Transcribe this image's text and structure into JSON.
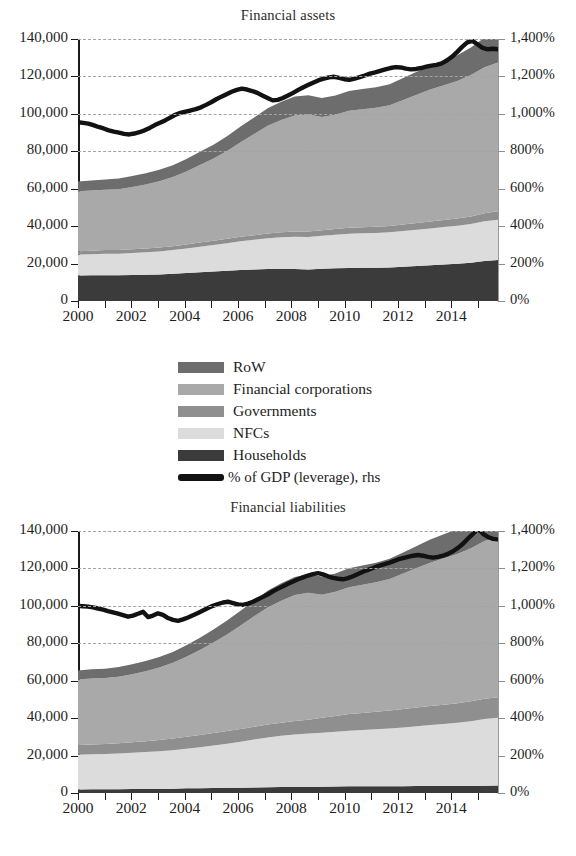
{
  "figure": {
    "legend": [
      {
        "key": "row",
        "label": "RoW",
        "color": "#6d6d6d",
        "type": "area"
      },
      {
        "key": "fincorp",
        "label": "Financial corporations",
        "color": "#a9a9a9",
        "type": "area"
      },
      {
        "key": "gov",
        "label": "Governments",
        "color": "#8f8f8f",
        "type": "area"
      },
      {
        "key": "nfc",
        "label": "NFCs",
        "color": "#dcdcdc",
        "type": "area"
      },
      {
        "key": "hh",
        "label": "Households",
        "color": "#3b3b3b",
        "type": "area"
      },
      {
        "key": "leverage",
        "label": "% of GDP (leverage), rhs",
        "color": "#121212",
        "type": "line"
      }
    ]
  },
  "chart_data": [
    {
      "type": "area",
      "stacked": true,
      "title": "Financial assets",
      "xlabel": "",
      "ylabel": "",
      "grid": true,
      "legend_position": "below",
      "x": [
        2000,
        2000.5,
        2001,
        2001.5,
        2002,
        2002.5,
        2003,
        2003.5,
        2004,
        2004.5,
        2005,
        2005.5,
        2006,
        2006.5,
        2007,
        2007.5,
        2008,
        2008.5,
        2009,
        2009.5,
        2010,
        2010.5,
        2011,
        2011.5,
        2012,
        2012.5,
        2013,
        2013.5,
        2014,
        2014.5,
        2015,
        2015.5
      ],
      "xtick_labels": [
        "2000",
        "2002",
        "2004",
        "2006",
        "2008",
        "2010",
        "2012",
        "2014"
      ],
      "xlim": [
        2000,
        2015.75
      ],
      "ylim": [
        0,
        140000
      ],
      "ytick_labels": [
        "0",
        "20,000",
        "40,000",
        "60,000",
        "80,000",
        "100,000",
        "120,000",
        "140,000"
      ],
      "y2lim": [
        0,
        1400
      ],
      "y2tick_labels": [
        "0%",
        "200%",
        "400%",
        "600%",
        "800%",
        "1,000%",
        "1,200%",
        "1,400%"
      ],
      "series": [
        {
          "name": "Households",
          "color": "#3b3b3b",
          "values": [
            13600,
            13700,
            13800,
            13700,
            13900,
            14000,
            14200,
            14500,
            14900,
            15300,
            15700,
            16100,
            16500,
            16800,
            17100,
            17200,
            17100,
            16800,
            17200,
            17500,
            17700,
            17800,
            17800,
            17900,
            18300,
            18700,
            19100,
            19500,
            19900,
            20500,
            21400,
            21900
          ]
        },
        {
          "name": "NFCs",
          "color": "#dcdcdc",
          "values": [
            11200,
            11300,
            11500,
            11600,
            11800,
            12000,
            12300,
            12700,
            13200,
            13700,
            14200,
            14800,
            15400,
            15900,
            16400,
            16800,
            17200,
            17400,
            17600,
            17900,
            18200,
            18400,
            18600,
            18800,
            19100,
            19400,
            19700,
            20000,
            20300,
            20700,
            21200,
            21500
          ]
        },
        {
          "name": "Governments",
          "color": "#8f8f8f",
          "values": [
            1800,
            1800,
            1900,
            1900,
            1950,
            2000,
            2050,
            2100,
            2150,
            2200,
            2250,
            2300,
            2400,
            2500,
            2600,
            2700,
            2800,
            2900,
            3000,
            3100,
            3200,
            3250,
            3300,
            3350,
            3450,
            3550,
            3650,
            3750,
            3850,
            4000,
            4300,
            4500
          ]
        },
        {
          "name": "Financial corporations",
          "color": "#a9a9a9",
          "values": [
            32000,
            32300,
            32200,
            32500,
            33200,
            34200,
            35500,
            37000,
            39000,
            41500,
            44000,
            47000,
            50500,
            54000,
            57500,
            60000,
            62000,
            62500,
            60500,
            61000,
            62500,
            63000,
            63500,
            64500,
            66500,
            68500,
            70500,
            72000,
            73500,
            75500,
            78000,
            79500
          ]
        },
        {
          "name": "RoW",
          "color": "#6d6d6d",
          "values": [
            5200,
            5300,
            5500,
            5700,
            5900,
            6000,
            6100,
            6300,
            6600,
            7000,
            7400,
            7900,
            8400,
            8900,
            9400,
            9800,
            10200,
            10400,
            10200,
            10300,
            10600,
            10800,
            11000,
            11300,
            11800,
            12300,
            12800,
            13300,
            13800,
            14700,
            15800,
            16400
          ]
        }
      ],
      "line_series": {
        "name": "% of GDP (leverage), rhs",
        "color": "#121212",
        "axis": "right",
        "values": [
          955,
          952,
          948,
          940,
          930,
          922,
          912,
          905,
          900,
          893,
          890,
          895,
          902,
          912,
          925,
          940,
          952,
          965,
          980,
          995,
          1005,
          1012,
          1018,
          1025,
          1035,
          1048,
          1062,
          1078,
          1092,
          1105,
          1118,
          1128,
          1135,
          1130,
          1122,
          1112,
          1098,
          1085,
          1072,
          1075,
          1085,
          1098,
          1112,
          1128,
          1142,
          1155,
          1168,
          1180,
          1188,
          1195,
          1198,
          1192,
          1185,
          1182,
          1188,
          1196,
          1205,
          1215,
          1222,
          1230,
          1238,
          1245,
          1250,
          1248,
          1242,
          1238,
          1240,
          1245,
          1252,
          1258,
          1262,
          1270,
          1285,
          1305,
          1330,
          1358,
          1382,
          1390,
          1372,
          1352,
          1345,
          1348,
          1345
        ]
      }
    },
    {
      "type": "area",
      "stacked": true,
      "title": "Financial liabilities",
      "xlabel": "",
      "ylabel": "",
      "grid": true,
      "legend_position": "above",
      "x": [
        2000,
        2000.5,
        2001,
        2001.5,
        2002,
        2002.5,
        2003,
        2003.5,
        2004,
        2004.5,
        2005,
        2005.5,
        2006,
        2006.5,
        2007,
        2007.5,
        2008,
        2008.5,
        2009,
        2009.5,
        2010,
        2010.5,
        2011,
        2011.5,
        2012,
        2012.5,
        2013,
        2013.5,
        2014,
        2014.5,
        2015,
        2015.5
      ],
      "xtick_labels": [
        "2000",
        "2002",
        "2004",
        "2006",
        "2008",
        "2010",
        "2012",
        "2014"
      ],
      "xlim": [
        2000,
        2015.75
      ],
      "ylim": [
        0,
        140000
      ],
      "ytick_labels": [
        "0",
        "20,000",
        "40,000",
        "60,000",
        "80,000",
        "100,000",
        "120,000",
        "140,000"
      ],
      "y2lim": [
        0,
        1400
      ],
      "y2tick_labels": [
        "0%",
        "200%",
        "400%",
        "600%",
        "800%",
        "1,000%",
        "1,200%",
        "1,400%"
      ],
      "series": [
        {
          "name": "Households",
          "color": "#3b3b3b",
          "values": [
            1900,
            1950,
            2000,
            2050,
            2100,
            2150,
            2200,
            2300,
            2500,
            2600,
            2700,
            2750,
            2800,
            2950,
            3100,
            3150,
            3200,
            3250,
            3400,
            3500,
            3550,
            3580,
            3600,
            3620,
            3650,
            3680,
            3700,
            3720,
            3750,
            3800,
            3900,
            3950
          ]
        },
        {
          "name": "NFCs",
          "color": "#dcdcdc",
          "values": [
            18500,
            18700,
            18900,
            19100,
            19400,
            19700,
            20100,
            20600,
            21200,
            21900,
            22700,
            23600,
            24600,
            25600,
            26600,
            27400,
            28100,
            28500,
            28800,
            29200,
            29700,
            30100,
            30500,
            30900,
            31400,
            32000,
            32600,
            33200,
            33800,
            34600,
            35600,
            36200
          ]
        },
        {
          "name": "Governments",
          "color": "#8f8f8f",
          "values": [
            5200,
            5250,
            5300,
            5400,
            5600,
            5800,
            6000,
            6200,
            6400,
            6550,
            6700,
            6800,
            6850,
            6900,
            6950,
            7000,
            7150,
            7400,
            8000,
            8500,
            8900,
            9100,
            9300,
            9500,
            9800,
            10000,
            10200,
            10300,
            10400,
            10600,
            10900,
            11000
          ]
        },
        {
          "name": "Financial corporations",
          "color": "#a9a9a9",
          "values": [
            35000,
            35300,
            35200,
            35600,
            36300,
            37400,
            38800,
            40500,
            42700,
            45400,
            48300,
            51600,
            55300,
            59000,
            62500,
            65200,
            67300,
            67800,
            65800,
            66300,
            67800,
            68500,
            69200,
            70300,
            72400,
            74500,
            76600,
            78200,
            79800,
            81800,
            84300,
            85800
          ]
        },
        {
          "name": "RoW",
          "color": "#6d6d6d",
          "values": [
            4800,
            4900,
            5000,
            5200,
            5400,
            5500,
            5600,
            5800,
            6100,
            6500,
            6900,
            7400,
            7900,
            8400,
            8900,
            9300,
            9700,
            9900,
            9700,
            9800,
            10100,
            10300,
            10500,
            10800,
            11300,
            11800,
            12300,
            12800,
            13300,
            14200,
            15300,
            15900
          ]
        }
      ],
      "line_series": {
        "name": "% of GDP (leverage), rhs",
        "color": "#121212",
        "axis": "right",
        "values": [
          1000,
          998,
          996,
          992,
          986,
          980,
          972,
          965,
          958,
          950,
          942,
          948,
          958,
          968,
          940,
          948,
          960,
          952,
          935,
          925,
          920,
          928,
          938,
          950,
          962,
          975,
          988,
          1000,
          1010,
          1018,
          1022,
          1015,
          1008,
          1005,
          1012,
          1022,
          1035,
          1048,
          1062,
          1078,
          1092,
          1105,
          1118,
          1130,
          1142,
          1152,
          1162,
          1170,
          1175,
          1168,
          1158,
          1150,
          1145,
          1142,
          1148,
          1158,
          1170,
          1182,
          1192,
          1202,
          1212,
          1220,
          1228,
          1238,
          1248,
          1255,
          1262,
          1268,
          1272,
          1268,
          1262,
          1258,
          1262,
          1268,
          1278,
          1292,
          1310,
          1332,
          1360,
          1385,
          1412,
          1385,
          1368,
          1358,
          1355
        ]
      }
    }
  ]
}
